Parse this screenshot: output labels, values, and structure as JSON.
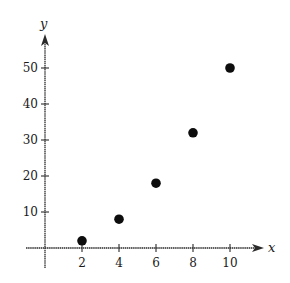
{
  "chart_data": {
    "type": "scatter",
    "title": "",
    "xlabel": "x",
    "ylabel": "y",
    "x": [
      2,
      4,
      6,
      8,
      10
    ],
    "y": [
      2,
      8,
      18,
      32,
      50
    ],
    "series": [
      {
        "name": "points",
        "x": [
          2,
          4,
          6,
          8,
          10
        ],
        "y": [
          2,
          8,
          18,
          32,
          50
        ]
      }
    ],
    "xticks": [
      "2",
      "4",
      "6",
      "8",
      "10"
    ],
    "yticks": [
      "10",
      "20",
      "30",
      "40",
      "50"
    ],
    "xlim": [
      -0.5,
      11.7
    ],
    "ylim": [
      -5,
      59
    ],
    "grid": false,
    "legend": null,
    "marker_color": "#0d0d0d"
  }
}
